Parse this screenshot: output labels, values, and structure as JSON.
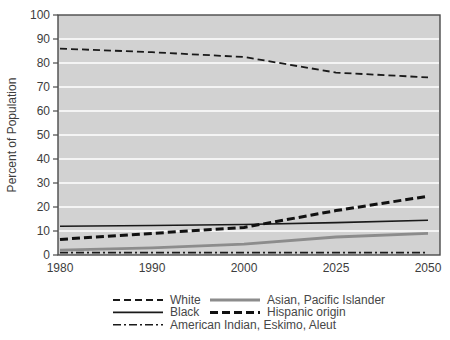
{
  "chart_data": {
    "type": "line",
    "title": "",
    "xlabel": "",
    "ylabel": "Percent of Population",
    "ylim": [
      0,
      100
    ],
    "y_ticks": [
      0,
      10,
      20,
      30,
      40,
      50,
      60,
      70,
      80,
      90,
      100
    ],
    "categories": [
      "1980",
      "1990",
      "2000",
      "2025",
      "2050"
    ],
    "x_axis_note": "categories evenly spaced despite unequal year intervals",
    "series": [
      {
        "name": "White",
        "values": [
          86,
          84.5,
          82.5,
          76,
          74
        ],
        "color": "#1a1a1a",
        "width": 1.8,
        "dash": "7,4"
      },
      {
        "name": "Black",
        "values": [
          12,
          12.3,
          12.7,
          13.5,
          14.5
        ],
        "color": "#1a1a1a",
        "width": 1.6,
        "dash": ""
      },
      {
        "name": "American Indian, Eskimo, Aleut",
        "values": [
          1,
          1,
          1,
          1,
          1
        ],
        "color": "#1a1a1a",
        "width": 1.6,
        "dash": "8,3,2,3"
      },
      {
        "name": "Asian, Pacific Islander",
        "values": [
          2,
          3,
          4.5,
          7.5,
          9
        ],
        "color": "#8c8c8c",
        "width": 2.8,
        "dash": ""
      },
      {
        "name": "Hispanic origin",
        "values": [
          6.5,
          9,
          11.5,
          18.5,
          24.5
        ],
        "color": "#111111",
        "width": 3.0,
        "dash": "8,4"
      }
    ],
    "legend": {
      "position": "bottom",
      "column1_order": [
        "White",
        "Black",
        "American Indian, Eskimo, Aleut"
      ],
      "column2_order": [
        "Asian, Pacific Islander",
        "Hispanic origin"
      ]
    },
    "grid": "horizontal white gridlines on gray plot area",
    "plot_bg_color": "#d2d2d2",
    "gridline_color": "#ffffff",
    "axis_color": "#4a4a4a",
    "text_color": "#3d3d3d"
  }
}
